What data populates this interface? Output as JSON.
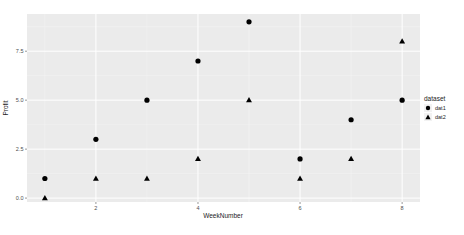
{
  "chart_data": {
    "type": "scatter",
    "title": "",
    "xlabel": "WeekNumber",
    "ylabel": "Profit",
    "x": [
      1,
      2,
      3,
      4,
      5,
      6,
      7,
      8
    ],
    "series": [
      {
        "name": "dat1",
        "shape": "circle",
        "values": [
          1,
          3,
          5,
          7,
          9,
          2,
          4,
          5
        ]
      },
      {
        "name": "dat2",
        "shape": "triangle",
        "values": [
          0,
          1,
          1,
          2,
          5,
          1,
          2,
          8
        ]
      }
    ],
    "xticks": [
      2,
      4,
      6,
      8
    ],
    "xtick_labels": [
      "2",
      "4",
      "6",
      "8"
    ],
    "yticks": [
      0,
      2.5,
      5,
      7.5
    ],
    "ytick_labels": [
      "0.0",
      "2.5",
      "5.0",
      "7.5"
    ],
    "xlim": [
      0.65,
      8.35
    ],
    "ylim": [
      -0.2,
      9.4
    ],
    "grid": true,
    "legend": {
      "title": "dataset",
      "position": "right",
      "entries": [
        "dat1",
        "dat2"
      ]
    },
    "colors": {
      "panel": "#ebebeb",
      "grid_major": "#ffffff",
      "grid_minor": "#f5f5f5",
      "point": "#000000"
    }
  }
}
